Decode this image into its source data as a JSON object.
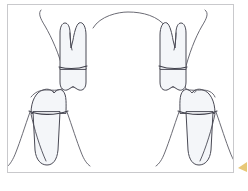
{
  "figure": {
    "canvas": {
      "width": 248,
      "height": 191,
      "background_color": "#ffffff"
    },
    "frame": {
      "border_color": "#c9c9cc",
      "fill_color": "#ffffff",
      "x": 7,
      "y": 4,
      "width": 227,
      "height": 169
    },
    "style": {
      "stroke_color": "#4a4a55",
      "stroke_width": 1.0,
      "tooth_fill": "#f4f6f9",
      "tooth_fill_shadow": "#eef1f5",
      "marker_color": "#e8c878"
    },
    "elements": [
      {
        "name": "upper-left-tooth",
        "type": "tooth",
        "position": "upper-left",
        "label": "Upper left tooth with bifurcated root",
        "crown_width": 30,
        "root_count": 2
      },
      {
        "name": "upper-right-tooth",
        "type": "tooth",
        "position": "upper-right",
        "label": "Upper right tooth with bifurcated root",
        "crown_width": 30,
        "root_count": 2
      },
      {
        "name": "lower-left-molar",
        "type": "molar",
        "position": "lower-left",
        "label": "Lower left molar with roots",
        "crown_width": 34,
        "root_count": 2
      },
      {
        "name": "lower-right-molar",
        "type": "molar",
        "position": "lower-right",
        "label": "Lower right molar with roots",
        "crown_width": 34,
        "root_count": 2
      },
      {
        "name": "palatal-arch",
        "type": "arch-curve",
        "label": "Central palatal arch connecting upper gum lines"
      },
      {
        "name": "gingival-outline-left",
        "type": "gum-line",
        "label": "Left gingival contour"
      },
      {
        "name": "gingival-outline-right",
        "type": "gum-line",
        "label": "Right gingival contour"
      }
    ],
    "corner_marker": {
      "name": "corner-marker",
      "label": "Yellow corner accent",
      "color": "#e8c878",
      "visible": true
    }
  }
}
